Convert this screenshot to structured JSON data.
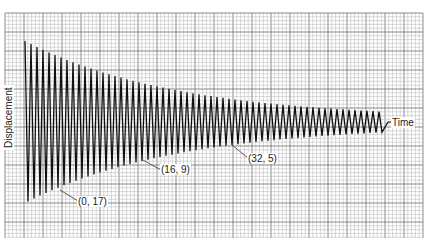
{
  "chart_data": {
    "type": "line",
    "title": "",
    "xlabel": "Time",
    "ylabel": "Displacement",
    "grid": true,
    "annotations": [
      {
        "label": "(0, 17)",
        "x": 0,
        "y": 17
      },
      {
        "label": "(16, 9)",
        "x": 16,
        "y": 9
      },
      {
        "label": "(32, 5)",
        "x": 32,
        "y": 5
      }
    ],
    "envelope": {
      "x": [
        0,
        16,
        32
      ],
      "amplitude": [
        17,
        9,
        5
      ]
    },
    "series": [
      {
        "name": "Displacement",
        "cycles_shown": 60,
        "initial_amplitude": 17,
        "final_amplitude": 0.6
      }
    ]
  },
  "colors": {
    "background": "#ffffff",
    "grid_minor": "#b5b5b5",
    "grid_major": "#6e6e6e",
    "trace": "#111111"
  },
  "labels": {
    "x_axis": "Time",
    "y_axis": "Displacement",
    "point_0": "(0, 17)",
    "point_16": "(16, 9)",
    "point_32": "(32, 5)"
  }
}
